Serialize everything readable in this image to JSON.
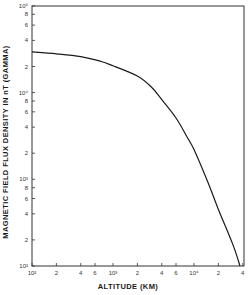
{
  "chart_data": {
    "type": "line",
    "title": "",
    "xlabel": "ALTITUDE (KM)",
    "ylabel": "MAGNETIC FIELD FLUX DENSITY IN nT (GAMMA)",
    "xscale": "log",
    "yscale": "log",
    "xlim": [
      100,
      40000
    ],
    "ylim": [
      100,
      100000
    ],
    "grid": false,
    "legend": null,
    "x_ticks": [
      {
        "value": 100,
        "label": "10²"
      },
      {
        "value": 200,
        "label": "2"
      },
      {
        "value": 400,
        "label": "4"
      },
      {
        "value": 600,
        "label": "6"
      },
      {
        "value": 1000,
        "label": "10³"
      },
      {
        "value": 2000,
        "label": "2"
      },
      {
        "value": 4000,
        "label": "4"
      },
      {
        "value": 6000,
        "label": "6"
      },
      {
        "value": 10000,
        "label": "10⁴"
      },
      {
        "value": 20000,
        "label": "2"
      },
      {
        "value": 40000,
        "label": "4"
      }
    ],
    "y_ticks": [
      {
        "value": 100,
        "label": "10²"
      },
      {
        "value": 200,
        "label": "2"
      },
      {
        "value": 400,
        "label": "4"
      },
      {
        "value": 600,
        "label": "6"
      },
      {
        "value": 800,
        "label": "8"
      },
      {
        "value": 1000,
        "label": "10³"
      },
      {
        "value": 2000,
        "label": "2"
      },
      {
        "value": 4000,
        "label": "4"
      },
      {
        "value": 6000,
        "label": "6"
      },
      {
        "value": 8000,
        "label": "8"
      },
      {
        "value": 10000,
        "label": "10⁴"
      },
      {
        "value": 20000,
        "label": "2"
      },
      {
        "value": 40000,
        "label": "4"
      },
      {
        "value": 60000,
        "label": "6"
      },
      {
        "value": 80000,
        "label": "8"
      },
      {
        "value": 100000,
        "label": "10⁵"
      }
    ],
    "series": [
      {
        "name": "Magnetic field flux density",
        "x": [
          100,
          200,
          400,
          700,
          1000,
          2000,
          3000,
          4000,
          6000,
          8000,
          10000,
          15000,
          20000,
          30000,
          37000
        ],
        "y": [
          29500,
          28000,
          26000,
          23000,
          20400,
          15500,
          11500,
          8300,
          5100,
          3200,
          2200,
          900,
          450,
          180,
          100
        ]
      }
    ]
  },
  "layout": {
    "plot": {
      "left": 32,
      "top": 6,
      "right": 244,
      "bottom": 266
    },
    "x_decade_px": 81,
    "y_decade_px": 86.7,
    "line_color": "#1a1a1a",
    "frame_color": "#333333"
  }
}
